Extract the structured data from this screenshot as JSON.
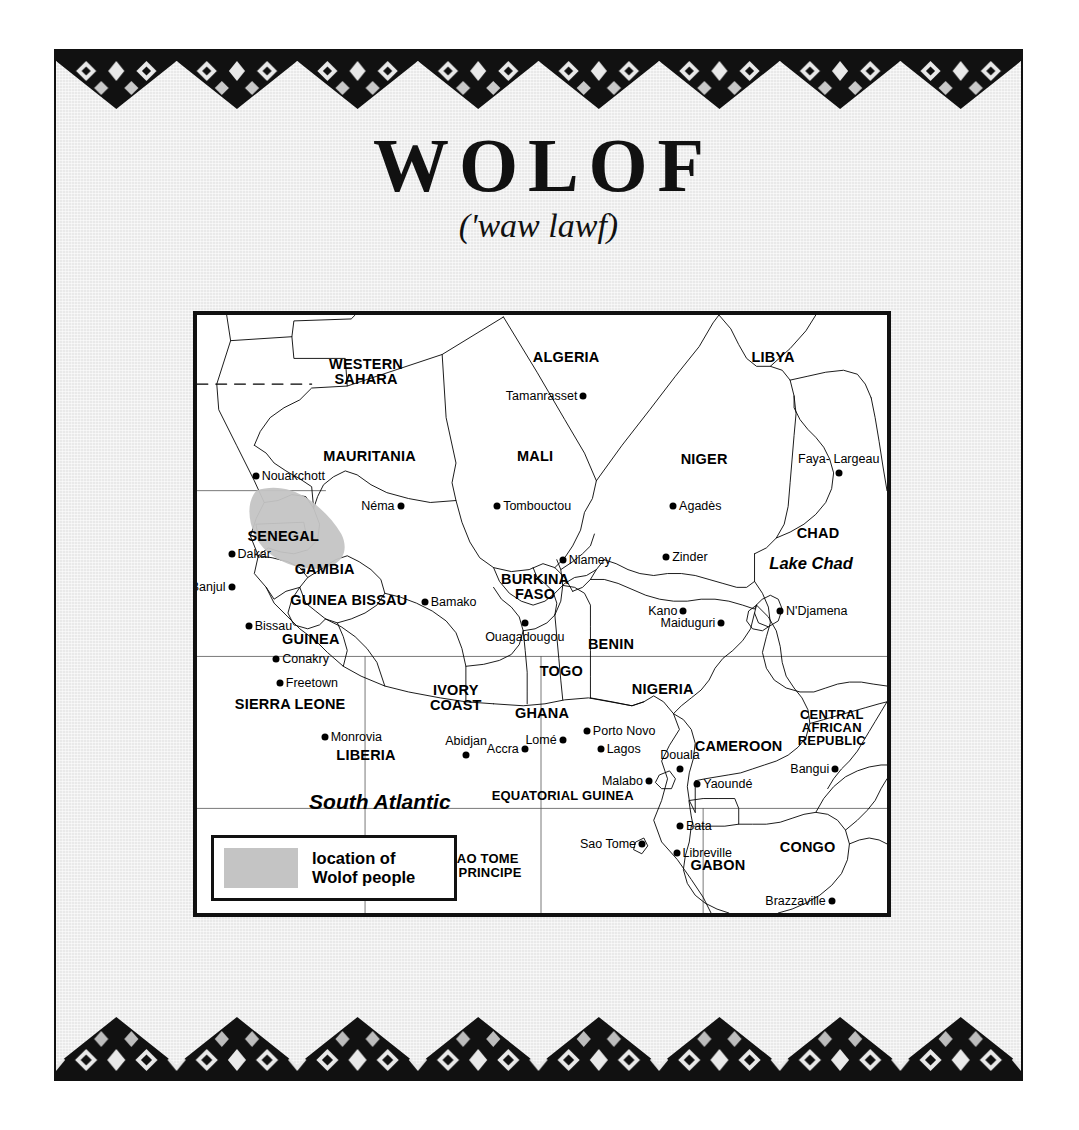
{
  "page": {
    "title": "WOLOF",
    "pronunciation": "('waw lawf)",
    "background_color": "#e9e9e9",
    "border_pattern": "african-textile-zigzag"
  },
  "legend": {
    "swatch_color": "#c4c4c4",
    "line1": "location of",
    "line2": "Wolof people"
  },
  "map": {
    "highlight_color": "#c4c4c4",
    "countries": [
      {
        "name": "WESTERN\nSAHARA",
        "x": 24.5,
        "y": 9.5
      },
      {
        "name": "ALGERIA",
        "x": 53.5,
        "y": 7.0
      },
      {
        "name": "LIBYA",
        "x": 83.5,
        "y": 7.0
      },
      {
        "name": "MAURITANIA",
        "x": 25.0,
        "y": 23.5
      },
      {
        "name": "MALI",
        "x": 49.0,
        "y": 23.5
      },
      {
        "name": "NIGER",
        "x": 73.5,
        "y": 24.0
      },
      {
        "name": "CHAD",
        "x": 90.0,
        "y": 36.5
      },
      {
        "name": "SENEGAL",
        "x": 12.5,
        "y": 37.0
      },
      {
        "name": "GAMBIA",
        "x": 18.5,
        "y": 42.5
      },
      {
        "name": "GUINEA BISSAU",
        "x": 22.0,
        "y": 47.7
      },
      {
        "name": "BURKINA\nFASO",
        "x": 49.0,
        "y": 45.5
      },
      {
        "name": "GUINEA",
        "x": 16.5,
        "y": 54.2
      },
      {
        "name": "SIERRA LEONE",
        "x": 13.5,
        "y": 65.0
      },
      {
        "name": "LIBERIA",
        "x": 24.5,
        "y": 73.5
      },
      {
        "name": "IVORY\nCOAST",
        "x": 37.5,
        "y": 64.0
      },
      {
        "name": "GHANA",
        "x": 50.0,
        "y": 66.5
      },
      {
        "name": "TOGO",
        "x": 52.8,
        "y": 59.5
      },
      {
        "name": "BENIN",
        "x": 60.0,
        "y": 55.0
      },
      {
        "name": "NIGERIA",
        "x": 67.5,
        "y": 62.5
      },
      {
        "name": "CAMEROON",
        "x": 78.5,
        "y": 72.0
      },
      {
        "name": "CENTRAL\nAFRICAN\nREPUBLIC",
        "x": 92.0,
        "y": 69.0
      },
      {
        "name": "EQUATORIAL GUINEA",
        "x": 53.0,
        "y": 80.5
      },
      {
        "name": "SAO TOME\n& PRINCIPE",
        "x": 41.5,
        "y": 92.0
      },
      {
        "name": "GABON",
        "x": 75.5,
        "y": 92.0
      },
      {
        "name": "CONGO",
        "x": 88.5,
        "y": 89.0
      }
    ],
    "cities": [
      {
        "name": "Tamanrasset",
        "x": 56.0,
        "y": 13.5,
        "label_side": "left"
      },
      {
        "name": "Nouakchott",
        "x": 8.5,
        "y": 27.0,
        "label_side": "right"
      },
      {
        "name": "Néma",
        "x": 29.5,
        "y": 32.0,
        "label_side": "left"
      },
      {
        "name": "Tombouctou",
        "x": 43.5,
        "y": 32.0,
        "label_side": "right"
      },
      {
        "name": "Agadès",
        "x": 69.0,
        "y": 32.0,
        "label_side": "right"
      },
      {
        "name": "Faya-Largeau",
        "x": 93.0,
        "y": 26.5,
        "label_side": "above"
      },
      {
        "name": "Dakar",
        "x": 5.0,
        "y": 40.0,
        "label_side": "right"
      },
      {
        "name": "Banjul",
        "x": 5.0,
        "y": 45.5,
        "label_side": "left"
      },
      {
        "name": "Niamey",
        "x": 53.0,
        "y": 41.0,
        "label_side": "right"
      },
      {
        "name": "Zinder",
        "x": 68.0,
        "y": 40.5,
        "label_side": "right"
      },
      {
        "name": "Bamako",
        "x": 33.0,
        "y": 48.0,
        "label_side": "right"
      },
      {
        "name": "Bissau",
        "x": 7.5,
        "y": 52.0,
        "label_side": "right"
      },
      {
        "name": "Ouagadougou",
        "x": 47.5,
        "y": 51.5,
        "label_side": "below"
      },
      {
        "name": "Kano",
        "x": 70.5,
        "y": 49.5,
        "label_side": "left"
      },
      {
        "name": "Maiduguri",
        "x": 76.0,
        "y": 51.5,
        "label_side": "left"
      },
      {
        "name": "N'Djamena",
        "x": 84.5,
        "y": 49.5,
        "label_side": "right"
      },
      {
        "name": "Conakry",
        "x": 11.5,
        "y": 57.5,
        "label_side": "right"
      },
      {
        "name": "Freetown",
        "x": 12.0,
        "y": 61.5,
        "label_side": "right"
      },
      {
        "name": "Monrovia",
        "x": 18.5,
        "y": 70.5,
        "label_side": "right"
      },
      {
        "name": "Abidjan",
        "x": 39.0,
        "y": 73.5,
        "label_side": "above"
      },
      {
        "name": "Accra",
        "x": 47.5,
        "y": 72.5,
        "label_side": "left"
      },
      {
        "name": "Lomé",
        "x": 53.0,
        "y": 71.0,
        "label_side": "left"
      },
      {
        "name": "Porto Novo",
        "x": 56.5,
        "y": 69.5,
        "label_side": "right"
      },
      {
        "name": "Lagos",
        "x": 58.5,
        "y": 72.5,
        "label_side": "right"
      },
      {
        "name": "Malabo",
        "x": 65.5,
        "y": 78.0,
        "label_side": "left"
      },
      {
        "name": "Douala",
        "x": 70.0,
        "y": 76.0,
        "label_side": "above"
      },
      {
        "name": "Yaoundé",
        "x": 72.5,
        "y": 78.5,
        "label_side": "right"
      },
      {
        "name": "Bangui",
        "x": 92.5,
        "y": 76.0,
        "label_side": "left"
      },
      {
        "name": "Bata",
        "x": 70.0,
        "y": 85.5,
        "label_side": "right"
      },
      {
        "name": "Sao Tome",
        "x": 64.5,
        "y": 88.5,
        "label_side": "left"
      },
      {
        "name": "Libreville",
        "x": 69.5,
        "y": 90.0,
        "label_side": "right"
      },
      {
        "name": "Brazzaville",
        "x": 92.0,
        "y": 98.0,
        "label_side": "left"
      }
    ],
    "water_labels": [
      {
        "name": "Lake Chad",
        "x": 89.0,
        "y": 41.5,
        "size": "normal"
      },
      {
        "name": "South Atlantic",
        "x": 26.5,
        "y": 81.5,
        "size": "big"
      }
    ]
  }
}
